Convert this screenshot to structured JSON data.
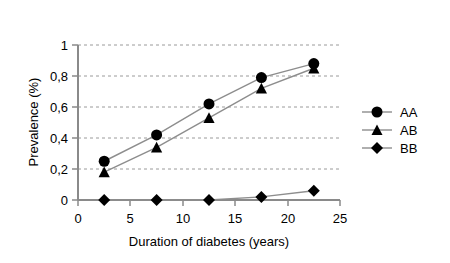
{
  "chart_data": {
    "type": "line",
    "title": "",
    "xlabel": "Duration of diabetes (years)",
    "ylabel": "Prevalence (%)",
    "x": [
      2.5,
      7.5,
      12.5,
      17.5,
      22.5
    ],
    "xlim": [
      0,
      25
    ],
    "ylim": [
      0,
      1
    ],
    "xticks": [
      "0",
      "5",
      "10",
      "15",
      "20",
      "25"
    ],
    "xtick_values": [
      0,
      5,
      10,
      15,
      20,
      25
    ],
    "yticks": [
      "0",
      "0,2",
      "0,4",
      "0,6",
      "0,8",
      "1"
    ],
    "ytick_values": [
      0,
      0.2,
      0.4,
      0.6,
      0.8,
      1
    ],
    "grid": "horizontal-dashed",
    "legend_position": "right",
    "series": [
      {
        "name": "AA",
        "marker": "circle",
        "values": [
          0.25,
          0.42,
          0.62,
          0.79,
          0.88
        ]
      },
      {
        "name": "AB",
        "marker": "triangle",
        "values": [
          0.18,
          0.34,
          0.53,
          0.72,
          0.85
        ]
      },
      {
        "name": "BB",
        "marker": "diamond",
        "values": [
          0.0,
          0.0,
          0.0,
          0.02,
          0.06
        ]
      }
    ]
  },
  "axes": {
    "x_title": "Duration of diabetes (years)",
    "y_title": "Prevalence (%)",
    "x_tick_labels": [
      "0",
      "5",
      "10",
      "15",
      "20",
      "25"
    ],
    "y_tick_labels": [
      "0",
      "0,2",
      "0,4",
      "0,6",
      "0,8",
      "1"
    ]
  },
  "legend": {
    "entries": [
      {
        "label": "AA",
        "marker": "circle"
      },
      {
        "label": "AB",
        "marker": "triangle"
      },
      {
        "label": "BB",
        "marker": "diamond"
      }
    ]
  },
  "colors": {
    "background": "#ffffff",
    "marker": "#000000",
    "line": "#8d8d8d",
    "grid": "#9a9a9a",
    "axis": "#8a8a8a",
    "text": "#000000"
  }
}
